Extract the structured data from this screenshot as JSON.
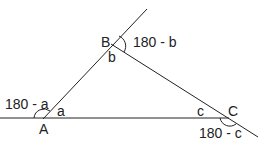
{
  "diagram": {
    "vertices": {
      "A": {
        "label": "A",
        "interior": "a",
        "exterior": "180 - a"
      },
      "B": {
        "label": "B",
        "interior": "b",
        "exterior": "180 - b"
      },
      "C": {
        "label": "C",
        "interior": "c",
        "exterior": "180 - c"
      }
    },
    "line_color": "#222222"
  }
}
